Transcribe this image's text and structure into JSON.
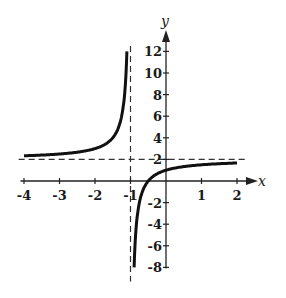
{
  "chart_data": {
    "type": "line",
    "title": "",
    "xlabel": "x",
    "ylabel": "y",
    "xlim": [
      -4,
      2
    ],
    "ylim": [
      -8,
      12
    ],
    "grid": false,
    "legend": null,
    "function": "y = 2 - 1/(x+1)",
    "x_ticks": [
      "-4",
      "-3",
      "-2",
      "-1",
      "1",
      "2"
    ],
    "y_ticks": [
      "12",
      "10",
      "8",
      "6",
      "4",
      "2",
      "-2",
      "-4",
      "-6",
      "-8"
    ],
    "asymptotes": [
      {
        "type": "vertical",
        "value": -1,
        "style": "dashed"
      },
      {
        "type": "horizontal",
        "value": 2,
        "style": "dashed"
      }
    ],
    "series": [
      {
        "name": "left-branch",
        "x": [
          -4,
          -3,
          -2,
          -1.5,
          -1.2,
          -1.1
        ],
        "y": [
          2.33,
          2.5,
          3,
          4,
          7,
          12
        ]
      },
      {
        "name": "right-branch",
        "x": [
          -0.9,
          -0.8,
          -0.5,
          0,
          1,
          2
        ],
        "y": [
          -8,
          -3,
          0,
          1,
          1.5,
          1.67
        ]
      }
    ]
  },
  "labels": {
    "x_axis": "x",
    "y_axis": "y",
    "x_ticks": [
      {
        "v": -4,
        "t": "-4"
      },
      {
        "v": -3,
        "t": "-3"
      },
      {
        "v": -2,
        "t": "-2"
      },
      {
        "v": -1,
        "t": "-1"
      },
      {
        "v": 1,
        "t": "1"
      },
      {
        "v": 2,
        "t": "2"
      }
    ],
    "y_ticks": [
      {
        "v": 12,
        "t": "12"
      },
      {
        "v": 10,
        "t": "10"
      },
      {
        "v": 8,
        "t": "8"
      },
      {
        "v": 6,
        "t": "6"
      },
      {
        "v": 4,
        "t": "4"
      },
      {
        "v": 2,
        "t": "2"
      },
      {
        "v": -2,
        "t": "-2"
      },
      {
        "v": -4,
        "t": "-4"
      },
      {
        "v": -6,
        "t": "-6"
      },
      {
        "v": -8,
        "t": "-8"
      }
    ]
  }
}
